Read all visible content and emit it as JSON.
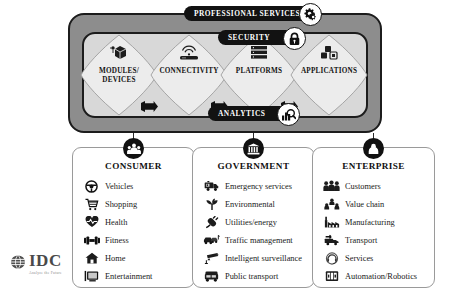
{
  "diagram": {
    "colors": {
      "outer_frame": "#8d8d8d",
      "inner_frame": "#d8d8d8",
      "pill_background": "#121212",
      "pill_text": "#ffffff",
      "lens_fill": "#eaeaea",
      "box_border": "#9a9a9a",
      "connector": "#2a2a2a"
    },
    "banners": [
      {
        "id": "professional-services",
        "label": "PROFESSIONAL SERVICES",
        "icon": "gears-icon"
      },
      {
        "id": "security",
        "label": "SECURITY",
        "icon": "padlock-icon"
      },
      {
        "id": "analytics",
        "label": "ANALYTICS",
        "icon": "chart-magnifier-icon"
      }
    ],
    "pillars": [
      {
        "id": "modules-devices",
        "label_lines": [
          "MODULES/",
          "DEVICES"
        ],
        "icon": "chip-cube-icon"
      },
      {
        "id": "connectivity",
        "label_lines": [
          "CONNECTIVITY"
        ],
        "icon": "wifi-router-icon"
      },
      {
        "id": "platforms",
        "label_lines": [
          "PLATFORMS"
        ],
        "icon": "server-stack-icon"
      },
      {
        "id": "applications",
        "label_lines": [
          "APPLICATIONS"
        ],
        "icon": "app-blocks-icon"
      }
    ],
    "arrows": [
      {
        "id": "arrow-1",
        "icon": "right-arrow-icon"
      },
      {
        "id": "arrow-2",
        "icon": "right-arrow-icon"
      },
      {
        "id": "arrow-3",
        "icon": "right-arrow-icon"
      }
    ],
    "segments": [
      {
        "id": "consumer",
        "title": "CONSUMER",
        "node_icon": "family-people-icon",
        "items": [
          {
            "label": "Vehicles",
            "icon": "steering-wheel-icon"
          },
          {
            "label": "Shopping",
            "icon": "shopping-cart-icon"
          },
          {
            "label": "Health",
            "icon": "heart-pulse-icon"
          },
          {
            "label": "Fitness",
            "icon": "dumbbell-icon"
          },
          {
            "label": "Home",
            "icon": "house-icon"
          },
          {
            "label": "Entertainment",
            "icon": "television-icon"
          }
        ]
      },
      {
        "id": "government",
        "title": "GOVERNMENT",
        "node_icon": "government-building-icon",
        "items": [
          {
            "label": "Emergency services",
            "icon": "ambulance-icon"
          },
          {
            "label": "Environmental",
            "icon": "plant-leaf-icon"
          },
          {
            "label": "Utilities/energy",
            "icon": "power-plug-icon"
          },
          {
            "label": "Traffic management",
            "icon": "traffic-cars-icon"
          },
          {
            "label": "Intelligent surveillance",
            "icon": "security-camera-icon"
          },
          {
            "label": "Public transport",
            "icon": "bus-icon"
          }
        ]
      },
      {
        "id": "enterprise",
        "title": "ENTERPRISE",
        "node_icon": "briefcase-person-icon",
        "items": [
          {
            "label": "Customers",
            "icon": "group-people-icon"
          },
          {
            "label": "Value chain",
            "icon": "hierarchy-people-icon"
          },
          {
            "label": "Manufacturing",
            "icon": "factory-icon"
          },
          {
            "label": "Transport",
            "icon": "delivery-truck-icon"
          },
          {
            "label": "Services",
            "icon": "headset-support-icon"
          },
          {
            "label": "Automation/Robotics",
            "icon": "robot-icon"
          }
        ]
      }
    ],
    "logo": {
      "wordmark": "IDC",
      "tagline": "Analyze the Future",
      "icon": "idc-globe-icon"
    }
  }
}
